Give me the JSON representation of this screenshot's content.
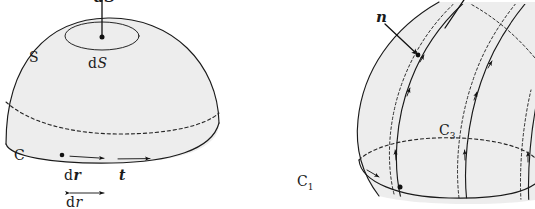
{
  "figure": {
    "background_color": "#ffffff",
    "ink_color": "#1a1a1a",
    "surface_fill_color": "#ececec"
  },
  "left_panel": {
    "name": "dome-surface-figure",
    "description": "Shaded dome surface S bounded by closed curve C, with element dS and its vector dS normal",
    "labels": {
      "vector_dS": "dS",
      "surface_S": "S",
      "element_dS": "dS",
      "element_dS_prefix": "d",
      "element_dS_symbol": "S",
      "curve_C": "C",
      "vector_dr_prefix": "d",
      "vector_dr_symbol": "r",
      "tangent_t": "t",
      "scalar_dr_prefix": "d",
      "scalar_dr_symbol": "r"
    }
  },
  "right_panel": {
    "name": "oriented-tube-surface-figure",
    "description": "Curved tube surface with outward normal n, bounding curves C1 and C3 and oriented meridian curves",
    "labels": {
      "normal_n": "n",
      "curve_C3_prefix": "C",
      "curve_C3_subscript": "3",
      "curve_C1_prefix": "C",
      "curve_C1_subscript": "1"
    }
  }
}
